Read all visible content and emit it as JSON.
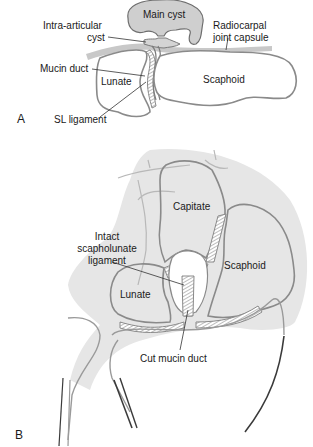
{
  "colors": {
    "bone_outline": "#8a8a8a",
    "cyst_fill": "#cfcfcf",
    "soft_tissue_fill": "#e6e6e6",
    "capsule": "#c8c8c8",
    "skin_line": "#3a3a3a",
    "text": "#1a1a1a",
    "background": "#ffffff"
  },
  "panel_a": {
    "label": "A",
    "labels": {
      "main_cyst": "Main cyst",
      "intra_articular_cyst_line1": "Intra-articular",
      "intra_articular_cyst_line2": "cyst",
      "radiocarpal_line1": "Radiocarpal",
      "radiocarpal_line2": "joint capsule",
      "mucin_duct": "Mucin duct",
      "lunate": "Lunate",
      "scaphoid": "Scaphoid",
      "sl_ligament": "SL ligament"
    }
  },
  "panel_b": {
    "label": "B",
    "labels": {
      "capitate": "Capitate",
      "intact_sl_line1": "Intact",
      "intact_sl_line2": "scapholunate",
      "intact_sl_line3": "ligament",
      "scaphoid": "Scaphoid",
      "lunate": "Lunate",
      "cut_mucin_duct": "Cut mucin duct"
    }
  }
}
